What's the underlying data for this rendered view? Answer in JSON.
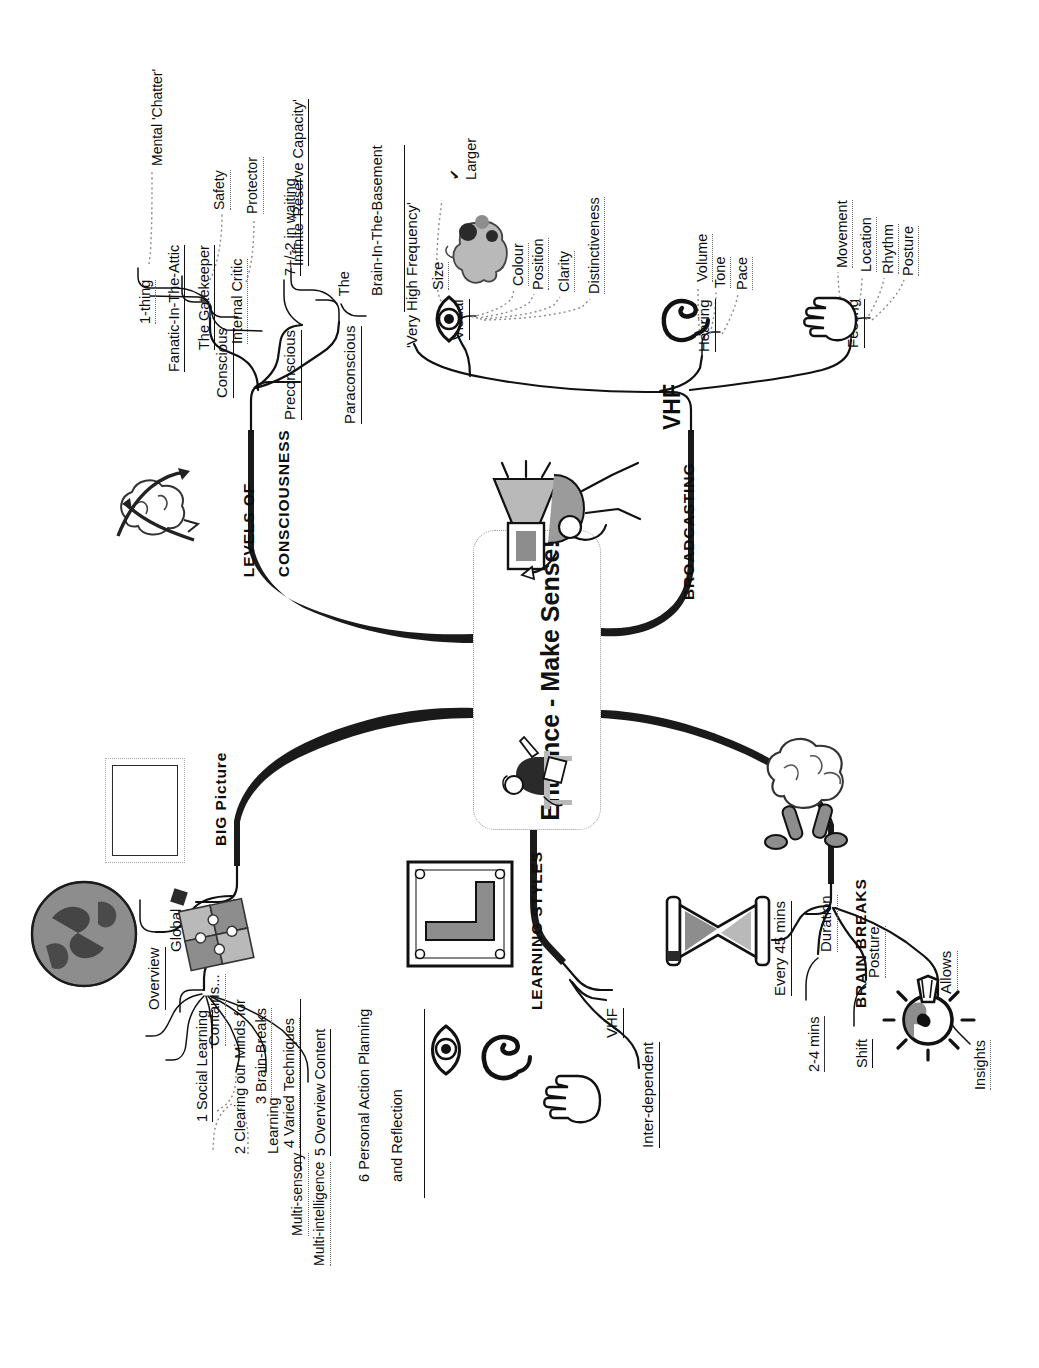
{
  "document": {
    "type": "mind-map",
    "orientation": "rotated-90-ccw",
    "central": {
      "line1": "Entrance",
      "line2": "- Make Sense!",
      "full": "Entrance - Make Sense!"
    }
  },
  "branches": [
    {
      "id": "levels-of-consciousness",
      "label_line1": "LEVELS OF",
      "label_line2": "CONSCIOUSNESS",
      "icon": "brain-arrows-icon",
      "children": [
        {
          "label": "Conscious",
          "children": [
            {
              "label": "1-thing"
            },
            {
              "label": "Fanatic-In-The-Attic",
              "children": [
                {
                  "label": "Mental 'Chatter'"
                }
              ]
            },
            {
              "label": "The Gatekeeper",
              "children": [
                {
                  "label": "Safety"
                }
              ]
            },
            {
              "label": "Internal Critic",
              "children": [
                {
                  "label": "Protector"
                }
              ]
            }
          ]
        },
        {
          "label": "Preconscious",
          "children": [
            {
              "label": "7+/-2 in waiting"
            }
          ]
        },
        {
          "label": "Paraconscious",
          "children": [
            {
              "label": "Infinite 'Reserve Capacity'"
            },
            {
              "label_line1": "The",
              "label_line2": "Brain-In-The-Basement"
            }
          ]
        }
      ]
    },
    {
      "id": "broadcasting",
      "label": "BROADCASTING",
      "icon": "megaphone-tv-icon",
      "children": [
        {
          "label": "VHF",
          "note": "'Very High Frequency'",
          "children": [
            {
              "label": "Visual",
              "icon": "eye-icon",
              "children": [
                {
                  "label": "Size",
                  "children": [
                    {
                      "label": "Larger",
                      "marker": "check-mark"
                    }
                  ],
                  "icon": "brain-colour-icon"
                },
                {
                  "label": "Colour"
                },
                {
                  "label": "Position"
                },
                {
                  "label": "Clarity"
                },
                {
                  "label": "Distinctiveness"
                }
              ]
            },
            {
              "label": "Hearing",
              "icon": "ear-icon",
              "children": [
                {
                  "label": "Volume"
                },
                {
                  "label": "Tone"
                },
                {
                  "label": "Pace"
                }
              ]
            },
            {
              "label": "Feeling",
              "icon": "hand-icon",
              "children": [
                {
                  "label": "Movement"
                },
                {
                  "label": "Location"
                },
                {
                  "label": "Rhythm"
                },
                {
                  "label": "Posture"
                }
              ]
            }
          ]
        }
      ]
    },
    {
      "id": "big-picture",
      "label": "BIG Picture",
      "icon": "framed-picture-icon",
      "children": [
        {
          "label": "Overview",
          "icon": "globe-icon",
          "children": [
            {
              "label": "Global"
            }
          ]
        },
        {
          "label": "Contains...",
          "icon": "jigsaw-icon",
          "children": [
            {
              "label": "1 Social Learning"
            },
            {
              "label_line1": "2 Clearing our Minds for",
              "label_line2": "Learning"
            },
            {
              "label": "3 Brain-Breaks"
            },
            {
              "label": "4 Varied Techniques",
              "children": [
                {
                  "label": "Multi-sensory"
                },
                {
                  "label": "Multi-intelligence"
                }
              ]
            },
            {
              "label": "5 Overview Content"
            },
            {
              "label_line1": "6 Personal Action Planning",
              "label_line2": "and Reflection"
            }
          ]
        }
      ]
    },
    {
      "id": "learning-styles",
      "label": "LEARNING STYLES",
      "icon": "l-plate-icon",
      "children": [
        {
          "label": "VHF",
          "icons": [
            "eye-icon",
            "ear-icon",
            "hand-icon"
          ]
        },
        {
          "label": "Inter-dependent"
        }
      ]
    },
    {
      "id": "brain-breaks",
      "label": "BRAIN BREAKS",
      "icon": "brain-walking-icon",
      "children": [
        {
          "label": "Every 45 mins",
          "icon": "hourglass-icon"
        },
        {
          "label": "Duration",
          "children": [
            {
              "label": "2-4 mins"
            }
          ]
        },
        {
          "label": "Posture",
          "children": [
            {
              "label": "Shift"
            }
          ]
        },
        {
          "label": "Allows",
          "children": [
            {
              "label": "Insights",
              "icon": "lightbulb-icon"
            }
          ]
        }
      ]
    }
  ],
  "colors": {
    "ink": "#111111",
    "branch_stroke": "#1a1a1a",
    "thin_stroke": "#4a4a4a",
    "dotted_stroke": "#8a8a8a",
    "paper": "#ffffff",
    "tone_light": "#b9b9b9",
    "tone_mid": "#8d8d8d",
    "tone_dark": "#2a2a2a"
  }
}
